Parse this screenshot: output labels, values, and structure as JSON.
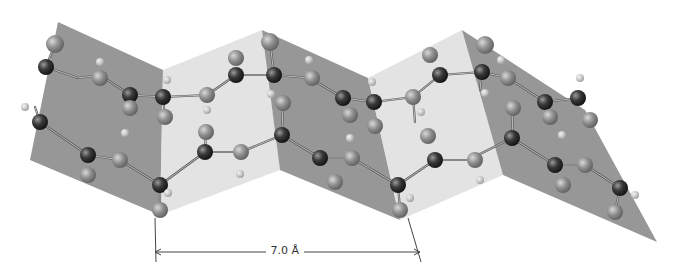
{
  "figure": {
    "dimension_label": "7.0 Å",
    "dimension": {
      "x1": 155,
      "x2": 420,
      "y": 252
    }
  },
  "colors": {
    "plane_dark": "#8c8c8c",
    "plane_light": "#dadada",
    "plane_mid": "#b4b4b4",
    "carbon": "#2e2e2e",
    "oxygen": "#8a8a8a",
    "hydrogen": "#c8c8c8",
    "bond": "#555555",
    "line": "#444444"
  },
  "planes": [
    {
      "shade": "dark",
      "points": "58,22 163,70 160,215 30,160"
    },
    {
      "shade": "light",
      "points": "163,70 262,30 280,170 160,215"
    },
    {
      "shade": "dark",
      "points": "262,30 368,78 400,220 280,170"
    },
    {
      "shade": "light",
      "points": "368,78 462,30 503,175 400,220"
    },
    {
      "shade": "dark",
      "points": "462,30 585,110 657,242 503,175"
    }
  ],
  "bonds": [
    [
      46,
      67,
      78,
      78
    ],
    [
      78,
      78,
      100,
      75
    ],
    [
      100,
      75,
      130,
      95
    ],
    [
      130,
      95,
      163,
      97
    ],
    [
      163,
      97,
      207,
      95
    ],
    [
      207,
      95,
      236,
      75
    ],
    [
      236,
      75,
      274,
      75
    ],
    [
      274,
      75,
      310,
      78
    ],
    [
      310,
      78,
      343,
      98
    ],
    [
      343,
      98,
      374,
      102
    ],
    [
      374,
      102,
      413,
      97
    ],
    [
      413,
      97,
      440,
      75
    ],
    [
      440,
      75,
      482,
      72
    ],
    [
      482,
      72,
      508,
      78
    ],
    [
      508,
      78,
      545,
      102
    ],
    [
      545,
      102,
      578,
      98
    ],
    [
      40,
      122,
      88,
      155
    ],
    [
      88,
      155,
      120,
      160
    ],
    [
      120,
      160,
      160,
      185
    ],
    [
      160,
      185,
      205,
      152
    ],
    [
      205,
      152,
      241,
      152
    ],
    [
      241,
      152,
      282,
      135
    ],
    [
      282,
      135,
      320,
      158
    ],
    [
      320,
      158,
      352,
      158
    ],
    [
      352,
      158,
      398,
      185
    ],
    [
      398,
      185,
      435,
      160
    ],
    [
      435,
      160,
      468,
      160
    ],
    [
      468,
      160,
      512,
      138
    ],
    [
      512,
      138,
      555,
      165
    ],
    [
      555,
      165,
      585,
      165
    ],
    [
      585,
      165,
      620,
      188
    ],
    [
      55,
      44,
      46,
      67
    ],
    [
      163,
      97,
      165,
      117
    ],
    [
      270,
      42,
      274,
      75
    ],
    [
      413,
      97,
      415,
      122
    ],
    [
      482,
      72,
      480,
      90
    ],
    [
      40,
      122,
      35,
      107
    ],
    [
      160,
      185,
      160,
      210
    ],
    [
      205,
      152,
      206,
      130
    ],
    [
      282,
      135,
      283,
      103
    ],
    [
      398,
      185,
      400,
      210
    ],
    [
      512,
      138,
      513,
      108
    ],
    [
      620,
      188,
      615,
      212
    ]
  ],
  "atoms": [
    {
      "type": "oxygen",
      "x": 55,
      "y": 44,
      "r": 9
    },
    {
      "type": "carbon",
      "x": 46,
      "y": 67,
      "r": 8
    },
    {
      "type": "hydrogen",
      "x": 100,
      "y": 62,
      "r": 4
    },
    {
      "type": "oxygen",
      "x": 100,
      "y": 78,
      "r": 8
    },
    {
      "type": "carbon",
      "x": 130,
      "y": 95,
      "r": 8
    },
    {
      "type": "oxygen",
      "x": 130,
      "y": 108,
      "r": 8
    },
    {
      "type": "hydrogen",
      "x": 167,
      "y": 80,
      "r": 4
    },
    {
      "type": "carbon",
      "x": 163,
      "y": 97,
      "r": 8
    },
    {
      "type": "oxygen",
      "x": 165,
      "y": 117,
      "r": 8
    },
    {
      "type": "oxygen",
      "x": 207,
      "y": 95,
      "r": 8
    },
    {
      "type": "hydrogen",
      "x": 207,
      "y": 110,
      "r": 4
    },
    {
      "type": "oxygen",
      "x": 236,
      "y": 58,
      "r": 8
    },
    {
      "type": "carbon",
      "x": 236,
      "y": 75,
      "r": 8
    },
    {
      "type": "oxygen",
      "x": 270,
      "y": 42,
      "r": 9
    },
    {
      "type": "carbon",
      "x": 274,
      "y": 75,
      "r": 8
    },
    {
      "type": "hydrogen",
      "x": 271,
      "y": 94,
      "r": 4
    },
    {
      "type": "hydrogen",
      "x": 309,
      "y": 60,
      "r": 4
    },
    {
      "type": "oxygen",
      "x": 312,
      "y": 78,
      "r": 8
    },
    {
      "type": "carbon",
      "x": 343,
      "y": 98,
      "r": 8
    },
    {
      "type": "oxygen",
      "x": 350,
      "y": 115,
      "r": 8
    },
    {
      "type": "hydrogen",
      "x": 372,
      "y": 82,
      "r": 4
    },
    {
      "type": "carbon",
      "x": 374,
      "y": 102,
      "r": 8
    },
    {
      "type": "oxygen",
      "x": 375,
      "y": 126,
      "r": 8
    },
    {
      "type": "oxygen",
      "x": 413,
      "y": 97,
      "r": 8
    },
    {
      "type": "hydrogen",
      "x": 421,
      "y": 112,
      "r": 4
    },
    {
      "type": "oxygen",
      "x": 430,
      "y": 55,
      "r": 8
    },
    {
      "type": "carbon",
      "x": 440,
      "y": 75,
      "r": 8
    },
    {
      "type": "oxygen",
      "x": 485,
      "y": 45,
      "r": 9
    },
    {
      "type": "carbon",
      "x": 482,
      "y": 72,
      "r": 8
    },
    {
      "type": "hydrogen",
      "x": 485,
      "y": 93,
      "r": 4
    },
    {
      "type": "hydrogen",
      "x": 501,
      "y": 60,
      "r": 4
    },
    {
      "type": "oxygen",
      "x": 508,
      "y": 78,
      "r": 8
    },
    {
      "type": "carbon",
      "x": 545,
      "y": 102,
      "r": 8
    },
    {
      "type": "oxygen",
      "x": 550,
      "y": 117,
      "r": 8
    },
    {
      "type": "hydrogen",
      "x": 580,
      "y": 78,
      "r": 4
    },
    {
      "type": "carbon",
      "x": 578,
      "y": 98,
      "r": 8
    },
    {
      "type": "oxygen",
      "x": 590,
      "y": 120,
      "r": 8
    },
    {
      "type": "hydrogen",
      "x": 25,
      "y": 107,
      "r": 4
    },
    {
      "type": "carbon",
      "x": 40,
      "y": 122,
      "r": 8
    },
    {
      "type": "carbon",
      "x": 88,
      "y": 155,
      "r": 8
    },
    {
      "type": "oxygen",
      "x": 88,
      "y": 175,
      "r": 8
    },
    {
      "type": "hydrogen",
      "x": 125,
      "y": 133,
      "r": 4
    },
    {
      "type": "oxygen",
      "x": 120,
      "y": 160,
      "r": 8
    },
    {
      "type": "carbon",
      "x": 160,
      "y": 185,
      "r": 8
    },
    {
      "type": "hydrogen",
      "x": 168,
      "y": 193,
      "r": 4
    },
    {
      "type": "oxygen",
      "x": 160,
      "y": 210,
      "r": 8
    },
    {
      "type": "oxygen",
      "x": 206,
      "y": 132,
      "r": 8
    },
    {
      "type": "carbon",
      "x": 205,
      "y": 152,
      "r": 8
    },
    {
      "type": "oxygen",
      "x": 241,
      "y": 152,
      "r": 8
    },
    {
      "type": "hydrogen",
      "x": 240,
      "y": 174,
      "r": 4
    },
    {
      "type": "oxygen",
      "x": 283,
      "y": 103,
      "r": 8
    },
    {
      "type": "carbon",
      "x": 282,
      "y": 135,
      "r": 8
    },
    {
      "type": "carbon",
      "x": 320,
      "y": 158,
      "r": 8
    },
    {
      "type": "oxygen",
      "x": 335,
      "y": 182,
      "r": 8
    },
    {
      "type": "hydrogen",
      "x": 350,
      "y": 138,
      "r": 4
    },
    {
      "type": "oxygen",
      "x": 352,
      "y": 158,
      "r": 8
    },
    {
      "type": "carbon",
      "x": 398,
      "y": 185,
      "r": 8
    },
    {
      "type": "hydrogen",
      "x": 410,
      "y": 198,
      "r": 4
    },
    {
      "type": "oxygen",
      "x": 400,
      "y": 210,
      "r": 8
    },
    {
      "type": "oxygen",
      "x": 428,
      "y": 136,
      "r": 8
    },
    {
      "type": "carbon",
      "x": 435,
      "y": 160,
      "r": 8
    },
    {
      "type": "oxygen",
      "x": 475,
      "y": 160,
      "r": 8
    },
    {
      "type": "hydrogen",
      "x": 480,
      "y": 180,
      "r": 4
    },
    {
      "type": "oxygen",
      "x": 513,
      "y": 108,
      "r": 8
    },
    {
      "type": "carbon",
      "x": 512,
      "y": 138,
      "r": 8
    },
    {
      "type": "carbon",
      "x": 555,
      "y": 165,
      "r": 8
    },
    {
      "type": "oxygen",
      "x": 563,
      "y": 185,
      "r": 8
    },
    {
      "type": "hydrogen",
      "x": 562,
      "y": 135,
      "r": 4
    },
    {
      "type": "oxygen",
      "x": 585,
      "y": 165,
      "r": 8
    },
    {
      "type": "carbon",
      "x": 620,
      "y": 188,
      "r": 8
    },
    {
      "type": "hydrogen",
      "x": 635,
      "y": 195,
      "r": 4
    },
    {
      "type": "oxygen",
      "x": 615,
      "y": 212,
      "r": 8
    }
  ]
}
